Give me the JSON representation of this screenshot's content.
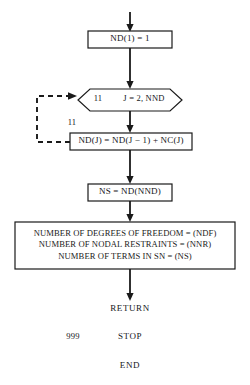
{
  "diagram": {
    "stroke_color": "#1a1a1a",
    "background_color": "#ffffff",
    "nodes": {
      "init_nd": {
        "text": "ND(1) = 1",
        "shape": "process-box"
      },
      "loop_header": {
        "label": "11",
        "range": "J = 2, NND",
        "shape": "hexagon"
      },
      "statement_number": "11",
      "assign_nd": {
        "text": "ND(J) = ND(J − 1) + NC(J)",
        "shape": "process-box"
      },
      "ns_assign": {
        "text": "NS = ND(NND)",
        "shape": "process-box"
      },
      "output": {
        "shape": "output-box",
        "lines": [
          "NUMBER OF DEGREES OF FREEDOM = (NDF)",
          "NUMBER OF NODAL RESTRAINTS = (NNR)",
          "NUMBER OF TERMS IN SN = (NS)"
        ]
      },
      "return_stmt": {
        "text": "RETURN"
      },
      "stop_stmt": {
        "label": "999",
        "text": "STOP"
      },
      "end_stmt": {
        "text": "END"
      }
    },
    "connectors": [
      {
        "name": "entry-arrow",
        "style": "solid",
        "direction": "down"
      },
      {
        "name": "init-to-loop-arrow",
        "style": "solid",
        "direction": "down"
      },
      {
        "name": "loop-to-assign-arrow",
        "style": "solid",
        "direction": "down"
      },
      {
        "name": "assign-to-ns-arrow",
        "style": "solid",
        "direction": "down"
      },
      {
        "name": "ns-to-output-arrow",
        "style": "solid",
        "direction": "down"
      },
      {
        "name": "output-to-return-arrow",
        "style": "solid",
        "direction": "down"
      },
      {
        "name": "loop-back-dashed",
        "style": "dashed",
        "direction": "left-up-right"
      }
    ]
  }
}
